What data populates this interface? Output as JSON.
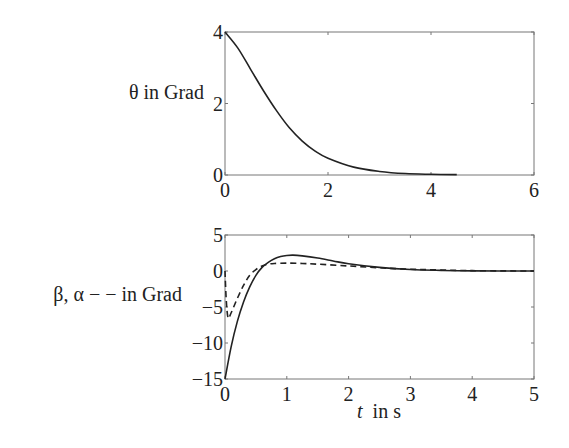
{
  "chart_data": [
    {
      "type": "line",
      "title": "",
      "ylabel": "θ  in Grad",
      "xlabel": "",
      "xlim": [
        0,
        6
      ],
      "ylim": [
        0,
        4
      ],
      "xticks": [
        "0",
        "2",
        "4",
        "6"
      ],
      "yticks": [
        "0",
        "2",
        "4"
      ],
      "grid": false,
      "series": [
        {
          "name": "θ",
          "style": "solid",
          "x": [
            0,
            0.25,
            0.5,
            0.75,
            1.0,
            1.25,
            1.5,
            1.75,
            2.0,
            2.5,
            3.0,
            3.5,
            4.0,
            4.5
          ],
          "values": [
            4.0,
            3.55,
            2.95,
            2.35,
            1.8,
            1.32,
            0.95,
            0.67,
            0.47,
            0.22,
            0.1,
            0.04,
            0.02,
            0.01
          ]
        }
      ]
    },
    {
      "type": "line",
      "title": "",
      "ylabel": "β, α − − in Grad",
      "xlabel": "t  in s",
      "xlim": [
        0,
        5
      ],
      "ylim": [
        -15,
        5
      ],
      "xticks": [
        "0",
        "1",
        "2",
        "3",
        "4",
        "5"
      ],
      "yticks": [
        "5",
        "0",
        "−5",
        "−10",
        "−15"
      ],
      "grid": false,
      "series": [
        {
          "name": "β",
          "style": "solid",
          "x": [
            0,
            0.1,
            0.2,
            0.3,
            0.4,
            0.5,
            0.6,
            0.7,
            0.8,
            0.9,
            1.0,
            1.1,
            1.25,
            1.5,
            1.75,
            2.0,
            2.5,
            3.0,
            3.5,
            4.0,
            5.0
          ],
          "values": [
            -15,
            -10.5,
            -7.0,
            -4.3,
            -2.2,
            -0.6,
            0.5,
            1.2,
            1.7,
            2.0,
            2.15,
            2.2,
            2.1,
            1.8,
            1.4,
            1.0,
            0.5,
            0.2,
            0.08,
            0.02,
            0
          ]
        },
        {
          "name": "α",
          "style": "dashed",
          "x": [
            0,
            0.02,
            0.05,
            0.1,
            0.2,
            0.3,
            0.4,
            0.5,
            0.6,
            0.7,
            0.8,
            1.0,
            1.25,
            1.5,
            2.0,
            2.5,
            3.0,
            4.0,
            5.0
          ],
          "values": [
            0,
            -4.0,
            -6.5,
            -5.8,
            -3.8,
            -2.0,
            -0.6,
            0.2,
            0.7,
            0.95,
            1.05,
            1.1,
            1.05,
            0.95,
            0.7,
            0.45,
            0.25,
            0.05,
            0
          ]
        }
      ]
    }
  ],
  "labels": {
    "top_ylabel": "θ  in Grad",
    "bottom_ylabel": "β, α − − in Grad",
    "bottom_xlabel_var": "t",
    "bottom_xlabel_unit": "  in s"
  }
}
